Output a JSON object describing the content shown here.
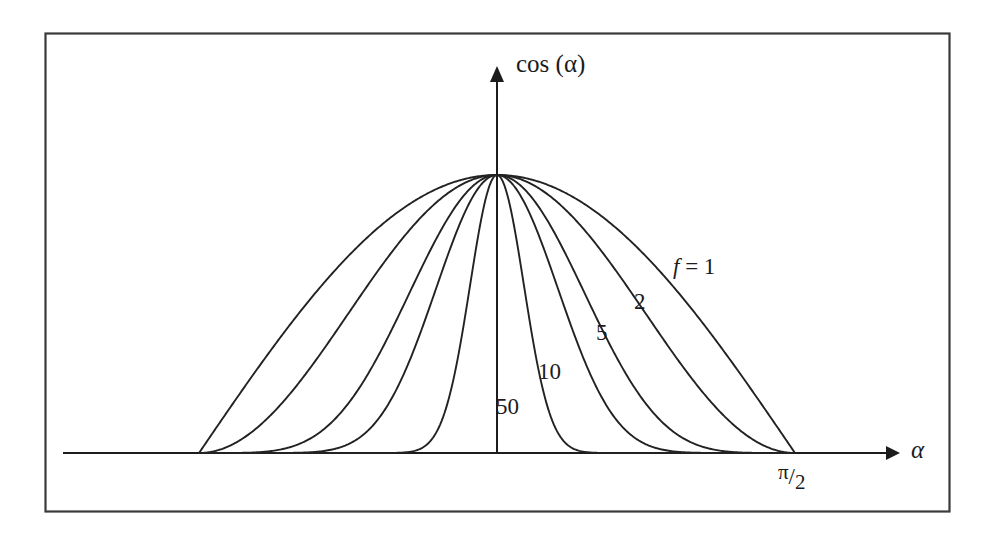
{
  "figure": {
    "frame": {
      "x": 45,
      "y": 33,
      "width": 905,
      "height": 479
    },
    "axis_origin": {
      "x": 497,
      "y": 453
    },
    "apex": {
      "x": 497,
      "y": 175
    }
  },
  "labels": {
    "y_axis": "cos (α)",
    "x_axis": "α",
    "x_tick_pi_half": {
      "numerator": "π",
      "slash": "/",
      "denominator": "2"
    },
    "curve_f1_prefix": "f",
    "curve_f1_equals": "= 1",
    "curve_f1_full": "f = 1",
    "curve_f2": "2",
    "curve_f5": "5",
    "curve_f10": "10",
    "curve_f50": "50"
  },
  "colors": {
    "ink": "#1c1c1c",
    "curve": "#222222",
    "frame": "#333333",
    "background": "#ffffff"
  },
  "chart_data": {
    "type": "line",
    "title": "",
    "subtitle": "",
    "xlabel": "α",
    "ylabel": "cos (α)",
    "xlim": [
      -1.5707963,
      1.5707963
    ],
    "ylim": [
      0,
      1
    ],
    "xticks": [
      1.5707963
    ],
    "xticklabels": [
      "π/2"
    ],
    "yticks": [],
    "yticklabels": [],
    "grid": false,
    "legend": "inline-curve-labels",
    "function": "y = cos(α)^f",
    "annotations": [
      {
        "text": "f = 1",
        "x": 0.98,
        "y": 0.52
      },
      {
        "text": "2",
        "x": 0.78,
        "y": 0.4
      },
      {
        "text": "5",
        "x": 0.6,
        "y": 0.29
      },
      {
        "text": "10",
        "x": 0.32,
        "y": 0.16
      },
      {
        "text": "50",
        "x": 0.06,
        "y": 0.05
      }
    ],
    "series": [
      {
        "name": "f = 1",
        "exponent": 1,
        "x": [
          -1.5708,
          -1.4137,
          -1.2566,
          -1.0996,
          -0.9425,
          -0.7854,
          -0.6283,
          -0.4712,
          -0.3142,
          -0.1571,
          0.0,
          0.1571,
          0.3142,
          0.4712,
          0.6283,
          0.7854,
          0.9425,
          1.0996,
          1.2566,
          1.4137,
          1.5708
        ],
        "y": [
          0.0,
          0.156,
          0.309,
          0.454,
          0.588,
          0.707,
          0.809,
          0.891,
          0.951,
          0.988,
          1.0,
          0.988,
          0.951,
          0.891,
          0.809,
          0.707,
          0.588,
          0.454,
          0.309,
          0.156,
          0.0
        ]
      },
      {
        "name": "2",
        "exponent": 2,
        "x": [
          -1.5708,
          -1.4137,
          -1.2566,
          -1.0996,
          -0.9425,
          -0.7854,
          -0.6283,
          -0.4712,
          -0.3142,
          -0.1571,
          0.0,
          0.1571,
          0.3142,
          0.4712,
          0.6283,
          0.7854,
          0.9425,
          1.0996,
          1.2566,
          1.4137,
          1.5708
        ],
        "y": [
          0.0,
          0.024,
          0.095,
          0.206,
          0.345,
          0.5,
          0.655,
          0.794,
          0.905,
          0.976,
          1.0,
          0.976,
          0.905,
          0.794,
          0.655,
          0.5,
          0.345,
          0.206,
          0.095,
          0.024,
          0.0
        ]
      },
      {
        "name": "5",
        "exponent": 5,
        "x": [
          -1.5708,
          -1.4137,
          -1.2566,
          -1.0996,
          -0.9425,
          -0.7854,
          -0.6283,
          -0.4712,
          -0.3142,
          -0.1571,
          0.0,
          0.1571,
          0.3142,
          0.4712,
          0.6283,
          0.7854,
          0.9425,
          1.0996,
          1.2566,
          1.4137,
          1.5708
        ],
        "y": [
          0.0,
          0.0001,
          0.0028,
          0.0193,
          0.0704,
          0.1768,
          0.3467,
          0.5611,
          0.7776,
          0.9409,
          1.0,
          0.9409,
          0.7776,
          0.5611,
          0.3467,
          0.1768,
          0.0704,
          0.0193,
          0.0028,
          0.0001,
          0.0
        ]
      },
      {
        "name": "10",
        "exponent": 10,
        "x": [
          -1.5708,
          -1.4137,
          -1.2566,
          -1.0996,
          -0.9425,
          -0.7854,
          -0.6283,
          -0.4712,
          -0.3142,
          -0.1571,
          0.0,
          0.1571,
          0.3142,
          0.4712,
          0.6283,
          0.7854,
          0.9425,
          1.0996,
          1.2566,
          1.4137,
          1.5708
        ],
        "y": [
          0.0,
          0.0,
          0.0,
          0.0004,
          0.005,
          0.0313,
          0.1202,
          0.3148,
          0.6046,
          0.8853,
          1.0,
          0.8853,
          0.6046,
          0.3148,
          0.1202,
          0.0313,
          0.005,
          0.0004,
          0.0,
          0.0,
          0.0
        ]
      },
      {
        "name": "50",
        "exponent": 50,
        "x": [
          -1.5708,
          -1.4137,
          -1.2566,
          -1.0996,
          -0.9425,
          -0.7854,
          -0.6283,
          -0.4712,
          -0.3142,
          -0.1571,
          0.0,
          0.1571,
          0.3142,
          0.4712,
          0.6283,
          0.7854,
          0.9425,
          1.0996,
          1.2566,
          1.4137,
          1.5708
        ],
        "y": [
          0.0,
          0.0,
          0.0,
          0.0,
          0.0,
          0.0,
          0.0,
          0.0031,
          0.0801,
          0.5447,
          1.0,
          0.5447,
          0.0801,
          0.0031,
          0.0,
          0.0,
          0.0,
          0.0,
          0.0,
          0.0,
          0.0
        ]
      }
    ]
  }
}
